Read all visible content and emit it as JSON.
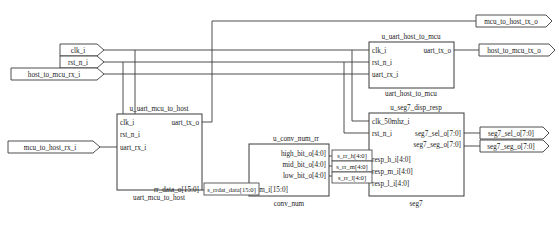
{
  "diagram": {
    "title_faint": "",
    "input_ports": [
      {
        "name": "clk-i-port",
        "label": "clk_i"
      },
      {
        "name": "rst-n-i-port",
        "label": "rst_n_i"
      },
      {
        "name": "host-to-mcu-rx-i-port",
        "label": "host_to_mcu_rx_i"
      },
      {
        "name": "mcu-to-host-rx-i-port",
        "label": "mcu_to_host_rx_i"
      }
    ],
    "output_ports": [
      {
        "name": "mcu-to-host-tx-o-port",
        "label": "mcu_to_host_tx_o"
      },
      {
        "name": "host-to-mcu-tx-o-port",
        "label": "host_to_mcu_tx_o"
      },
      {
        "name": "seg7-sel-o-port",
        "label": "seg7_sel_o[7:0]"
      },
      {
        "name": "seg7-seg-o-port",
        "label": "seg7_seg_o[7:0]"
      }
    ],
    "blocks": [
      {
        "key": "uart_mcu_to_host",
        "instance": "u_uart_mcu_to_host",
        "module": "uart_mcu_to_host",
        "inputs": [
          "clk_i",
          "rst_n_i",
          "uart_rx_i"
        ],
        "outputs": [
          "uart_tx_o",
          "rr_data_o[15:0]"
        ]
      },
      {
        "key": "uart_host_to_mcu",
        "instance": "u_uart_host_to_mcu",
        "module": "uart_host_to_mcu",
        "inputs": [
          "clk_i",
          "rst_n_i",
          "uart_rx_i"
        ],
        "outputs": [
          "uart_tx_o"
        ]
      },
      {
        "key": "conv_num",
        "instance": "u_conv_num_rr",
        "module": "conv_num",
        "inputs": [
          "num_i[15:0]"
        ],
        "outputs": [
          "high_bit_o[4:0]",
          "mid_bit_o[4:0]",
          "low_bit_o[4:0]"
        ]
      },
      {
        "key": "seg7",
        "instance": "u_seg7_disp_resp",
        "module": "seg7",
        "inputs": [
          "clk_50mhz_i",
          "rst_n_i",
          "resp_h_i[4:0]",
          "resp_m_i[4:0]",
          "resp_l_i[4:0]"
        ],
        "outputs": [
          "seg7_sel_o[7:0]",
          "seg7_seg_o[7:0]"
        ]
      }
    ],
    "net_labels": [
      {
        "name": "net-s-rrdat-data",
        "label": "s_rrdat_data[15:0]"
      },
      {
        "name": "net-s-rr-h",
        "label": "s_rr_h[4:0]"
      },
      {
        "name": "net-s-rr-m",
        "label": "s_rr_m[4:0]"
      },
      {
        "name": "net-s-rr-l",
        "label": "s_rr_l[4:0]"
      }
    ],
    "colors": {
      "line": "#3a3a3a",
      "text": "#1a1a1a",
      "background": "#ffffff"
    }
  }
}
